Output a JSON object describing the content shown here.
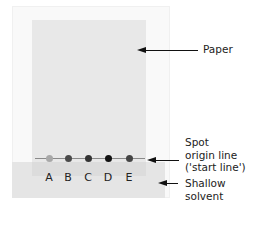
{
  "diagram": {
    "type": "paper-chromatography-setup",
    "labels": {
      "paper": "Paper",
      "origin_line_1": "Spot",
      "origin_line_2": "origin line",
      "origin_line_3": "('start line')",
      "solvent_1": "Shallow",
      "solvent_2": "solvent"
    },
    "spots": [
      {
        "label": "A",
        "color": "#a8a8a8"
      },
      {
        "label": "B",
        "color": "#4a4a4a"
      },
      {
        "label": "C",
        "color": "#333333"
      },
      {
        "label": "D",
        "color": "#111111"
      },
      {
        "label": "E",
        "color": "#444444"
      }
    ],
    "colors": {
      "paper": "#e8e8e8",
      "solvent": "#e5e5e5",
      "origin_line": "#8a8a8a",
      "arrow": "#111111"
    }
  }
}
